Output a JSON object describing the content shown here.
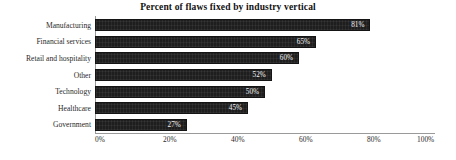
{
  "chart_data": {
    "type": "bar",
    "orientation": "horizontal",
    "title": "Percent of flaws fixed by industry vertical",
    "xlabel": "",
    "ylabel": "",
    "xlim": [
      0,
      100
    ],
    "grid": false,
    "legend": null,
    "categories": [
      "Manufacturing",
      "Financial services",
      "Retail and hospitality",
      "Other",
      "Technology",
      "Healthcare",
      "Government"
    ],
    "values": [
      81,
      65,
      60,
      52,
      50,
      45,
      27
    ],
    "value_labels": [
      "81%",
      "65%",
      "60%",
      "52%",
      "50%",
      "45%",
      "27%"
    ],
    "xticks": [
      0,
      20,
      40,
      60,
      80,
      100
    ],
    "xtick_labels": [
      "0%",
      "20%",
      "40%",
      "60%",
      "80%",
      "100%"
    ],
    "bar_color": "#1e1e1e",
    "value_label_color": "#f2f2f2",
    "axis_color": "#9a9a9a",
    "background": "#ffffff"
  }
}
